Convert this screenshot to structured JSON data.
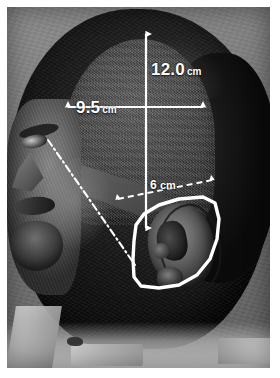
{
  "figure": {
    "type": "clinical-photograph",
    "view": "lateral head profile, left side",
    "border_color": "#ffffff",
    "annotation_color": "#ffffff"
  },
  "measurements": [
    {
      "id": "vertical",
      "name": "vertical-extent",
      "value": "12.0",
      "unit": "cm",
      "arrow": "double-headed solid vertical",
      "orientation": "vertical"
    },
    {
      "id": "horizontal",
      "name": "horizontal-extent",
      "value": "9.5",
      "unit": "cm",
      "arrow": "double-headed solid horizontal",
      "orientation": "horizontal"
    },
    {
      "id": "oblique",
      "name": "oblique-distance-to-ear",
      "value": "6",
      "unit": "cm",
      "arrow": "double-headed dashed oblique",
      "orientation": "oblique"
    }
  ],
  "markings": {
    "ear_outline": {
      "name": "ear-outline",
      "style": "solid white polygon",
      "描述": "white solid outline traced around the auricle"
    },
    "planning_line": {
      "name": "dash-dot-planning-line",
      "style": "white dash-dot diagonal line",
      "描述": "runs from superior-anterior temple inferiorly toward the ear"
    },
    "shaved_area": {
      "name": "shaved-scalp-patch",
      "描述": "clipped/shaved region of scalp enclosed by the measurements"
    }
  },
  "anatomy": [
    {
      "name": "hair",
      "label": "hair"
    },
    {
      "name": "forehead",
      "label": "forehead"
    },
    {
      "name": "eye",
      "label": "eye"
    },
    {
      "name": "nose",
      "label": "nose"
    },
    {
      "name": "mouth",
      "label": "mouth"
    },
    {
      "name": "chin",
      "label": "chin"
    },
    {
      "name": "ear",
      "label": "ear"
    },
    {
      "name": "drape",
      "label": "drape"
    }
  ]
}
